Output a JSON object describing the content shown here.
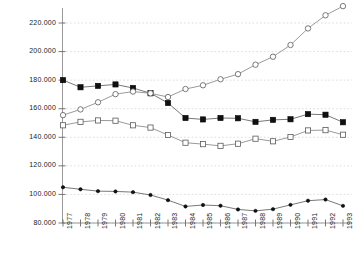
{
  "chart_data": {
    "type": "line",
    "title": "",
    "subtitle": "",
    "xlabel": "",
    "ylabel": "",
    "x": [
      1977,
      1978,
      1979,
      1980,
      1981,
      1982,
      1983,
      1984,
      1985,
      1986,
      1987,
      1988,
      1989,
      1990,
      1991,
      1992,
      1993
    ],
    "xtick_labels": [
      "1977",
      "1978",
      "1979",
      "1980",
      "1981",
      "1982",
      "1983",
      "1984",
      "1985",
      "1986",
      "1987",
      "1988",
      "1989",
      "1990",
      "1991",
      "1992",
      "1993"
    ],
    "ytick_labels": [
      "80.000",
      "100.000",
      "120.000",
      "140.000",
      "160.000",
      "180.000",
      "200.000",
      "220.000"
    ],
    "ytick_values": [
      80000,
      100000,
      120000,
      140000,
      160000,
      180000,
      200000,
      220000
    ],
    "ylim": [
      80000,
      234000
    ],
    "xlim": [
      1977,
      1993
    ],
    "grid": "horizontal-dashed",
    "legend": "none",
    "series": [
      {
        "name": "series-filled-square",
        "marker": "filled-square",
        "color": "#111111",
        "line_color": "#555555",
        "values": [
          180000,
          175000,
          176000,
          177000,
          174500,
          170800,
          164000,
          153500,
          152500,
          153500,
          153300,
          150800,
          152200,
          152600,
          156200,
          155800,
          150500
        ]
      },
      {
        "name": "series-open-circle",
        "marker": "open-circle",
        "color": "#ffffff",
        "line_color": "#808080",
        "values": [
          155500,
          159500,
          164500,
          170200,
          172000,
          170800,
          168200,
          173800,
          176400,
          180600,
          184200,
          190800,
          196400,
          204600,
          216200,
          225400,
          231800
        ]
      },
      {
        "name": "series-open-square",
        "marker": "open-square",
        "color": "#ffffff",
        "line_color": "#808080",
        "values": [
          148400,
          150800,
          151800,
          151600,
          148400,
          146800,
          141600,
          136200,
          135200,
          134000,
          135500,
          139000,
          137200,
          140200,
          144800,
          145000,
          141800
        ]
      },
      {
        "name": "series-small-filled-circle",
        "marker": "filled-circle",
        "color": "#111111",
        "line_color": "#555555",
        "values": [
          105000,
          103600,
          102300,
          102100,
          101600,
          99600,
          96000,
          91600,
          92600,
          92100,
          89500,
          88500,
          89700,
          92700,
          95600,
          96400,
          92000
        ]
      }
    ],
    "annotations": []
  },
  "axes": {
    "y_axis_name": "y-axis",
    "x_axis_name": "x-axis",
    "tick_color": "#9a9a9a",
    "grid_color": "#cfcfcf"
  }
}
